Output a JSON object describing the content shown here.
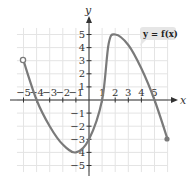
{
  "chart_data": {
    "type": "line",
    "title": "",
    "xlabel": "x",
    "ylabel": "y",
    "xlim": [
      -5.5,
      6
    ],
    "ylim": [
      -5.5,
      5.5
    ],
    "grid": true,
    "x_ticks": [
      -5,
      -4,
      -3,
      -2,
      -1,
      1,
      2,
      3,
      4,
      5
    ],
    "y_ticks": [
      5,
      4,
      3,
      2,
      1,
      -1,
      -2,
      -3,
      -4,
      -5
    ],
    "x_tick_labels": [
      "−5",
      "−4",
      "−3",
      "−2",
      "−1",
      "1",
      "2",
      "3",
      "4",
      "5"
    ],
    "y_tick_labels": [
      "5",
      "4",
      "3",
      "2",
      "1",
      "−1",
      "−2",
      "−3",
      "−4",
      "−5"
    ],
    "series": [
      {
        "name": "y = f(x)",
        "points": [
          {
            "x": -5,
            "y": 3
          },
          {
            "x": -4,
            "y": 0
          },
          {
            "x": -3,
            "y": -2
          },
          {
            "x": -2,
            "y": -3.4
          },
          {
            "x": -1,
            "y": -4
          },
          {
            "x": 0,
            "y": -3
          },
          {
            "x": 1,
            "y": 0
          },
          {
            "x": 1.5,
            "y": 4.3
          },
          {
            "x": 2,
            "y": 5
          },
          {
            "x": 3,
            "y": 4.2
          },
          {
            "x": 4,
            "y": 2.4
          },
          {
            "x": 5,
            "y": 0
          },
          {
            "x": 6,
            "y": -3
          }
        ],
        "endpoints": [
          {
            "x": -5,
            "y": 3,
            "style": "open"
          },
          {
            "x": 6,
            "y": -3,
            "style": "closed"
          }
        ]
      }
    ],
    "annotations": [
      {
        "text": "y = f(x)",
        "position": "upper-right"
      }
    ]
  },
  "labels": {
    "x_axis": "x",
    "y_axis": "y",
    "legend": "y = f(x)"
  }
}
